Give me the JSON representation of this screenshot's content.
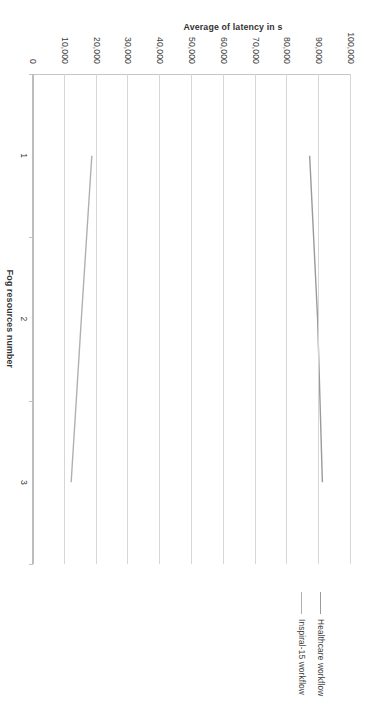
{
  "chart_data": {
    "type": "line",
    "title": "",
    "xlabel": "Fog resources number",
    "ylabel": "Average of latency in s",
    "categories": [
      "1",
      "2",
      "3"
    ],
    "x": [
      1,
      2,
      3
    ],
    "ylim": [
      0,
      100000
    ],
    "ytick_labels": [
      "0",
      "10,000",
      "20,000",
      "30,000",
      "40,000",
      "50,000",
      "60,000",
      "70,000",
      "80,000",
      "90,000",
      "100,000"
    ],
    "ytick_values": [
      0,
      10000,
      20000,
      30000,
      40000,
      50000,
      60000,
      70000,
      80000,
      90000,
      100000
    ],
    "grid": true,
    "legend_position": "top-right",
    "series": [
      {
        "name": "Healthcare workflow",
        "color": "#9a9a9a",
        "values": [
          87000,
          89500,
          91000
        ]
      },
      {
        "name": "Inspiral-15 workflow",
        "color": "#b0b0b0",
        "values": [
          18500,
          15200,
          12000
        ]
      }
    ]
  },
  "legend": {
    "items": [
      {
        "label": "Healthcare workflow"
      },
      {
        "label": "Inspiral-15 workflow"
      }
    ]
  },
  "axes": {
    "y_title": "Average of latency in s",
    "x_title": "Fog resources number"
  }
}
